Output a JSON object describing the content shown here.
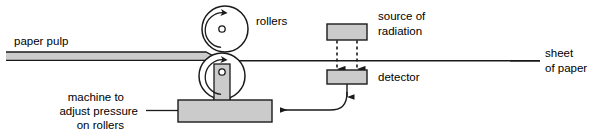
{
  "diagram": {
    "type": "process-schematic",
    "canvas": {
      "width": 594,
      "height": 137
    },
    "colors": {
      "background": "#ffffff",
      "outline": "#1a1a1a",
      "fill_gray": "#cccccc",
      "fill_gray_dark": "#c0c0c0",
      "text": "#000000"
    }
  },
  "labels": {
    "paper_pulp": "paper pulp",
    "rollers": "rollers",
    "source_of_radiation_line1": "source of",
    "source_of_radiation_line2": "radiation",
    "detector": "detector",
    "sheet_of_paper_line1": "sheet",
    "sheet_of_paper_line2": "of paper",
    "machine_line1": "machine to",
    "machine_line2": "adjust pressure",
    "machine_line3": "on rollers"
  },
  "parts": {
    "upper_roller": {
      "name": "upper roller",
      "center_x": 225,
      "center_y": 29,
      "radius": 23,
      "hub_radius": 3,
      "rotation": "clockwise"
    },
    "lower_roller": {
      "name": "lower roller",
      "center_x": 222,
      "center_y": 76,
      "radius": 23,
      "hub_radius": 3,
      "rotation": "clockwise"
    },
    "paper_pulp_band": {
      "name": "paper pulp feed",
      "left_x": 6,
      "right_x": 218,
      "top_y": 52,
      "bottom_y": 60
    },
    "sheet_line": {
      "name": "finished paper sheet",
      "left_x": 226,
      "right_x": 540,
      "y": 61
    },
    "source_box": {
      "name": "source of radiation",
      "x": 327,
      "y": 24,
      "width": 40,
      "height": 16
    },
    "detector_box": {
      "name": "detector",
      "x": 327,
      "y": 70,
      "width": 40,
      "height": 14
    },
    "machine_bar": {
      "name": "machine to adjust pressure on rollers",
      "x": 178,
      "y": 100,
      "width": 94,
      "height": 22
    },
    "shaft": {
      "name": "roller shaft",
      "x": 214,
      "y": 66,
      "width": 16,
      "height": 36
    },
    "beams": [
      {
        "name": "radiation-beam-left",
        "x": 337,
        "from_y": 41,
        "to_y": 68
      },
      {
        "name": "radiation-beam-right",
        "x": 357,
        "from_y": 41,
        "to_y": 68
      }
    ],
    "feedback_signal": {
      "name": "detector feedback signal to machine",
      "from": "detector",
      "to": "machine",
      "direction": "leftward"
    }
  }
}
